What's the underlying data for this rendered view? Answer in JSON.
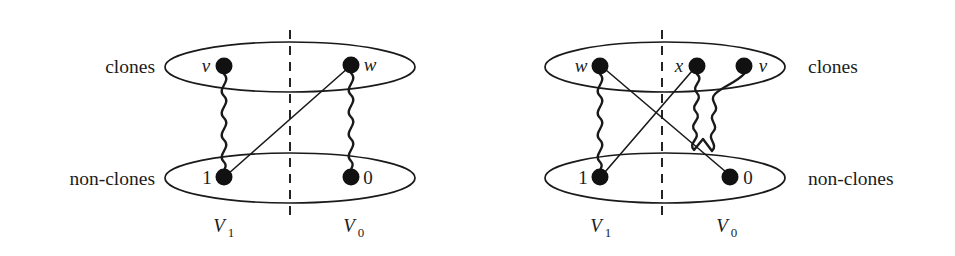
{
  "figure": {
    "type": "graph-diagram",
    "background_color": "#ffffff",
    "stroke_color": "#1a1a1a"
  },
  "panels": [
    {
      "id": "left-panel",
      "labels": {
        "clones": "clones",
        "non_clones": "non-clones",
        "clones_side": "left",
        "partition_left": "V",
        "partition_left_sub": "1",
        "partition_right": "V",
        "partition_right_sub": "0"
      },
      "ellipses": [
        {
          "name": "clones-ellipse",
          "cx": 290,
          "cy": 67,
          "rx": 125,
          "ry": 25
        },
        {
          "name": "non-clones-ellipse",
          "cx": 290,
          "cy": 178,
          "rx": 125,
          "ry": 25
        }
      ],
      "divider": {
        "x": 290,
        "y1": 30,
        "y2": 215
      },
      "nodes": [
        {
          "name": "node-v",
          "label": "v",
          "label_pos": "left",
          "x": 224,
          "y": 66,
          "r": 8.5,
          "group": "clones"
        },
        {
          "name": "node-w",
          "label": "w",
          "label_pos": "right",
          "x": 351,
          "y": 65,
          "r": 8.5,
          "group": "clones"
        },
        {
          "name": "node-1",
          "label": "1",
          "label_pos": "left",
          "x": 224,
          "y": 177,
          "r": 8.5,
          "group": "non-clones"
        },
        {
          "name": "node-0",
          "label": "0",
          "label_pos": "right",
          "x": 351,
          "y": 177,
          "r": 8.5,
          "group": "non-clones"
        }
      ],
      "edges": [
        {
          "name": "edge-v-1",
          "style": "wavy",
          "from": "node-v",
          "to": "node-1"
        },
        {
          "name": "edge-w-0",
          "style": "wavy",
          "from": "node-w",
          "to": "node-0"
        },
        {
          "name": "edge-w-1",
          "style": "straight",
          "from": "node-w",
          "to": "node-1"
        }
      ]
    },
    {
      "id": "right-panel",
      "labels": {
        "clones": "clones",
        "non_clones": "non-clones",
        "clones_side": "right",
        "partition_left": "V",
        "partition_left_sub": "1",
        "partition_right": "V",
        "partition_right_sub": "0"
      },
      "ellipses": [
        {
          "name": "clones-ellipse",
          "cx": 665,
          "cy": 67,
          "rx": 120,
          "ry": 25
        },
        {
          "name": "non-clones-ellipse",
          "cx": 665,
          "cy": 178,
          "rx": 120,
          "ry": 25
        }
      ],
      "divider": {
        "x": 662,
        "y1": 30,
        "y2": 215
      },
      "nodes": [
        {
          "name": "node-w",
          "label": "w",
          "label_pos": "left",
          "x": 600,
          "y": 66,
          "r": 8.5,
          "group": "clones"
        },
        {
          "name": "node-x",
          "label": "x",
          "label_pos": "left",
          "x": 697,
          "y": 66,
          "r": 8.5,
          "group": "clones"
        },
        {
          "name": "node-v",
          "label": "v",
          "label_pos": "right",
          "x": 744,
          "y": 66,
          "r": 8.5,
          "group": "clones"
        },
        {
          "name": "node-1",
          "label": "1",
          "label_pos": "left",
          "x": 600,
          "y": 177,
          "r": 8.5,
          "group": "non-clones"
        },
        {
          "name": "node-0",
          "label": "0",
          "label_pos": "right",
          "x": 730,
          "y": 177,
          "r": 8.5,
          "group": "non-clones"
        }
      ],
      "edges": [
        {
          "name": "edge-w-1",
          "style": "wavy",
          "from": "node-w",
          "to": "node-1"
        },
        {
          "name": "edge-x-v",
          "style": "wavy-loop",
          "from": "node-x",
          "to": "node-v"
        },
        {
          "name": "edge-w-0",
          "style": "straight",
          "from": "node-w",
          "to": "node-0"
        },
        {
          "name": "edge-x-1",
          "style": "straight",
          "from": "node-x",
          "to": "node-1"
        }
      ]
    }
  ],
  "text_items": {
    "left_clones": "clones",
    "left_non_clones": "non-clones",
    "left_v": "v",
    "left_w": "w",
    "left_one": "1",
    "left_zero": "0",
    "left_V1_base": "V",
    "left_V1_sub": "1",
    "left_V0_base": "V",
    "left_V0_sub": "0",
    "right_clones": "clones",
    "right_non_clones": "non-clones",
    "right_w": "w",
    "right_x": "x",
    "right_v": "v",
    "right_one": "1",
    "right_zero": "0",
    "right_V1_base": "V",
    "right_V1_sub": "1",
    "right_V0_base": "V",
    "right_V0_sub": "0"
  }
}
